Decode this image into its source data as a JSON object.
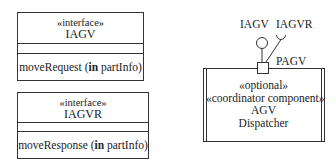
{
  "interfaces": [
    {
      "stereotype": "«interface»",
      "name": "IAGV",
      "operation": {
        "name": "moveRequest",
        "direction": "in",
        "param": "partInfo"
      }
    },
    {
      "stereotype": "«interface»",
      "name": "IAGVR",
      "operation": {
        "name": "moveResponse",
        "direction": "in",
        "param": "partInfo"
      }
    }
  ],
  "component": {
    "stereotypes": [
      "«optional»",
      "«coordinator component»"
    ],
    "name_lines": [
      "AGV",
      "Dispatcher"
    ],
    "port": {
      "name": "PAGV",
      "provided_interface": "IAGV",
      "required_interface": "IAGVR"
    }
  },
  "colors": {
    "line": "#333333",
    "background": "#ffffff"
  }
}
